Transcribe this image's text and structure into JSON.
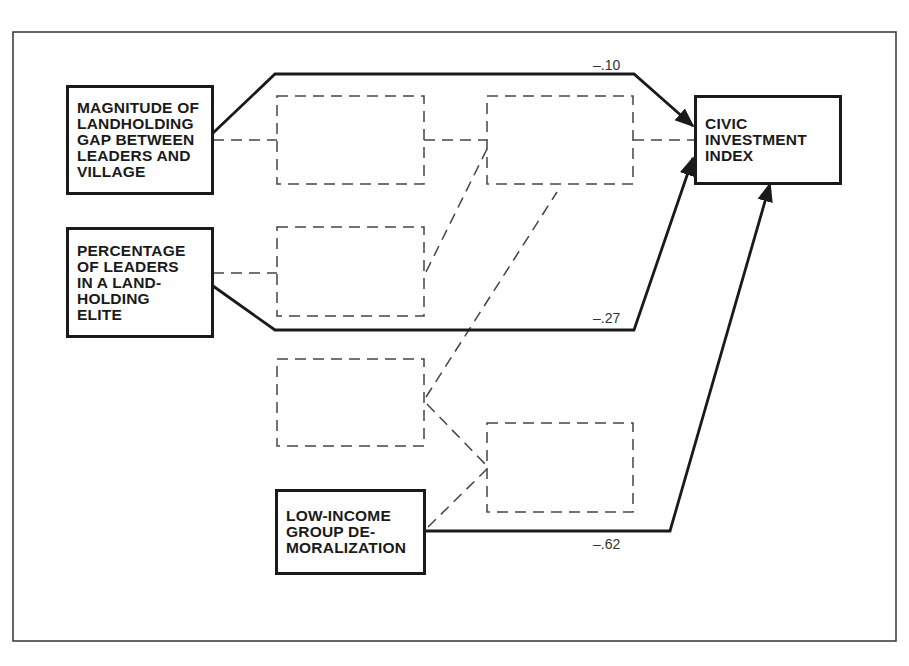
{
  "caption": "Figure ... (partially visible header text)",
  "nodes": {
    "landholding_gap": {
      "lines": [
        "MAGNITUDE OF",
        "LANDHOLDING",
        "GAP BETWEEN",
        "LEADERS AND",
        "VILLAGE"
      ]
    },
    "landholding_elite": {
      "lines": [
        "PERCENTAGE",
        "OF LEADERS",
        "IN A LAND-",
        "HOLDING",
        "ELITE"
      ]
    },
    "demoralization": {
      "lines": [
        "LOW-INCOME",
        "GROUP DE-",
        "MORALIZATION"
      ]
    },
    "civic_index": {
      "lines": [
        "CIVIC",
        "INVESTMENT",
        "INDEX"
      ]
    }
  },
  "coefficients": {
    "gap_to_civic": "–.10",
    "elite_to_civic": "–.27",
    "demoralization_to_civic": "–.62"
  },
  "colors": {
    "line": "#1a1a1a",
    "dashed": "#444444",
    "background": "#ffffff"
  }
}
